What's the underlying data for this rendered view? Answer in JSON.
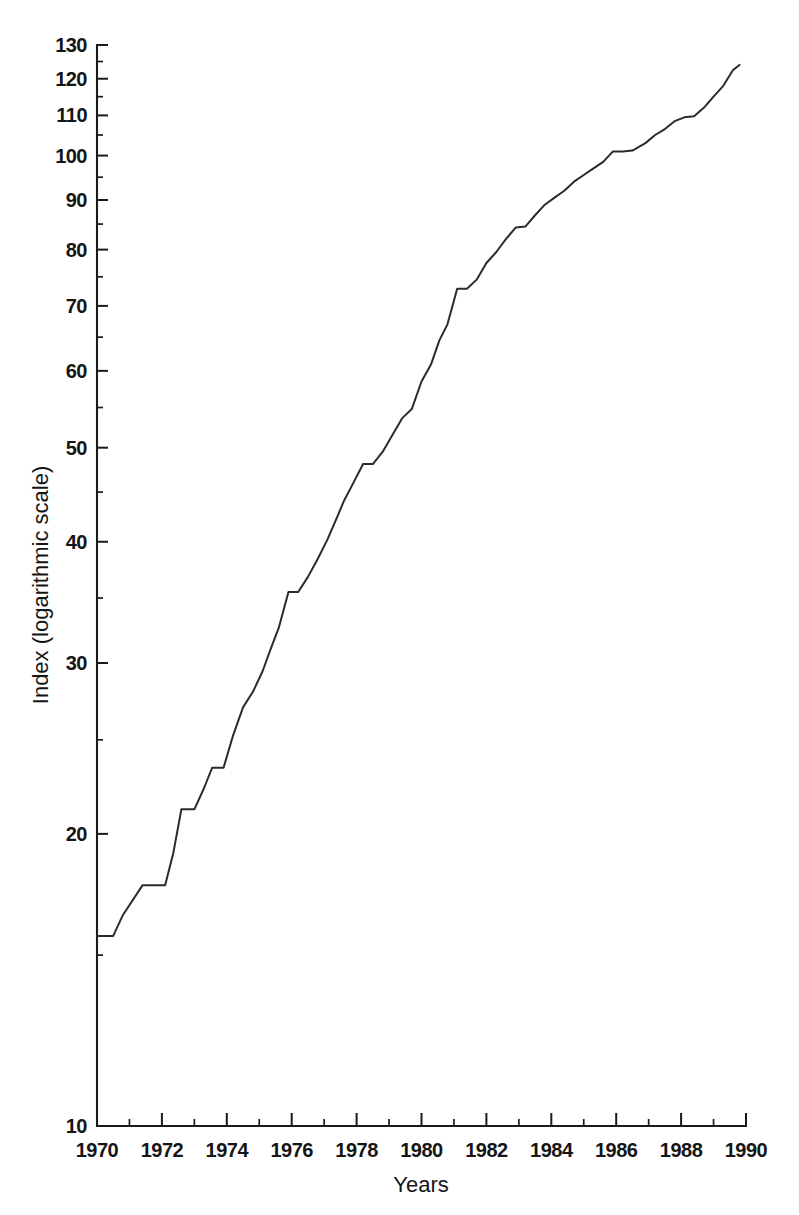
{
  "chart_data": {
    "type": "line",
    "title": "",
    "xlabel": "Years",
    "ylabel": "Index (logarithmic scale)",
    "yscale": "log",
    "xscale": "linear",
    "xlim": [
      1970,
      1990
    ],
    "ylim": [
      10,
      130
    ],
    "grid": false,
    "legend": null,
    "y_tick_labels": [
      "130",
      "120",
      "110",
      "100",
      "90",
      "80",
      "70",
      "60",
      "50",
      "40",
      "30",
      "20",
      "10"
    ],
    "y_tick_values": [
      130,
      120,
      110,
      100,
      90,
      80,
      70,
      60,
      50,
      40,
      30,
      20,
      10
    ],
    "y_minor_ticks": [
      15,
      25,
      35,
      45,
      55,
      65,
      75,
      85,
      95,
      105,
      115,
      125
    ],
    "x_tick_labels": [
      "1970",
      "1972",
      "1974",
      "1976",
      "1978",
      "1980",
      "1982",
      "1984",
      "1986",
      "1988",
      "1990"
    ],
    "x_tick_values": [
      1970,
      1972,
      1974,
      1976,
      1978,
      1980,
      1982,
      1984,
      1986,
      1988,
      1990
    ],
    "x_minor_ticks": [
      1971,
      1973,
      1975,
      1977,
      1979,
      1981,
      1983,
      1985,
      1987,
      1989
    ],
    "line_color": "#2b2b2b",
    "series": [
      {
        "name": "Index",
        "x": [
          1970.0,
          1970.5,
          1970.8,
          1971.4,
          1971.6,
          1972.1,
          1972.35,
          1972.6,
          1973.0,
          1973.3,
          1973.55,
          1973.9,
          1974.2,
          1974.5,
          1974.8,
          1975.1,
          1975.35,
          1975.6,
          1975.9,
          1976.2,
          1976.5,
          1976.8,
          1977.1,
          1977.4,
          1977.6,
          1977.9,
          1978.2,
          1978.5,
          1978.8,
          1979.1,
          1979.4,
          1979.7,
          1980.0,
          1980.3,
          1980.55,
          1980.8,
          1981.1,
          1981.4,
          1981.7,
          1982.0,
          1982.3,
          1982.6,
          1982.9,
          1983.2,
          1983.5,
          1983.8,
          1984.1,
          1984.4,
          1984.7,
          1985.0,
          1985.3,
          1985.6,
          1985.9,
          1986.2,
          1986.5,
          1986.9,
          1987.2,
          1987.5,
          1987.8,
          1988.1,
          1988.4,
          1988.7,
          1989.0,
          1989.3,
          1989.6,
          1989.8
        ],
        "y": [
          15.7,
          15.7,
          16.5,
          17.7,
          17.7,
          17.7,
          19.1,
          21.2,
          21.2,
          22.3,
          23.4,
          23.4,
          25.3,
          27.0,
          28.0,
          29.4,
          31.0,
          32.6,
          35.5,
          35.5,
          36.8,
          38.4,
          40.2,
          42.4,
          44.0,
          46.0,
          48.1,
          48.1,
          49.5,
          51.5,
          53.6,
          54.8,
          58.5,
          61.0,
          64.5,
          67.0,
          72.9,
          72.9,
          74.5,
          77.5,
          79.5,
          82.0,
          84.3,
          84.5,
          86.8,
          89.0,
          90.5,
          92.0,
          94.0,
          95.5,
          97.0,
          98.5,
          101.0,
          101.0,
          101.2,
          103.0,
          105.0,
          106.5,
          108.5,
          109.5,
          109.8,
          112.0,
          115.0,
          118.0,
          122.5,
          124.0
        ]
      }
    ]
  },
  "plot": {
    "axis_origin_x": 97,
    "axis_origin_y": 1126,
    "axis_right_x": 746,
    "axis_top_y": 45
  }
}
